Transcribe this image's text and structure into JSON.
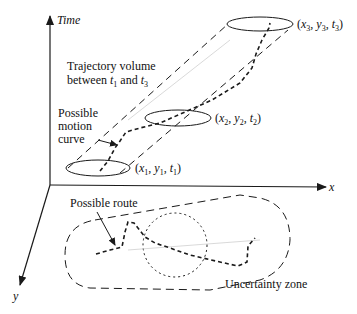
{
  "axes": {
    "time_label": "Time",
    "x_label": "x",
    "y_label": "y"
  },
  "labels": {
    "trajectory_volume_line1": "Trajectory volume",
    "trajectory_volume_line2_prefix": "between ",
    "trajectory_volume_t1": "t",
    "trajectory_volume_t1_sub": "1",
    "trajectory_volume_and": " and ",
    "trajectory_volume_t3": "t",
    "trajectory_volume_t3_sub": "3",
    "motion_curve_line1": "Possible",
    "motion_curve_line2": "motion",
    "motion_curve_line3": "curve",
    "possible_route": "Possible route",
    "uncertainty_zone": "Uncertainty zone"
  },
  "points": [
    {
      "id": "p1",
      "label": "(x1, y1, t1)",
      "x": "x",
      "y": "y",
      "t": "t",
      "sub": "1"
    },
    {
      "id": "p2",
      "label": "(x2, y2, t2)",
      "x": "x",
      "y": "y",
      "t": "t",
      "sub": "2"
    },
    {
      "id": "p3",
      "label": "(x3, y3, t3)",
      "x": "x",
      "y": "y",
      "t": "t",
      "sub": "3"
    }
  ],
  "colors": {
    "stroke": "#1a1a1a",
    "light_stroke": "#cfcfcf",
    "background": "#ffffff"
  }
}
